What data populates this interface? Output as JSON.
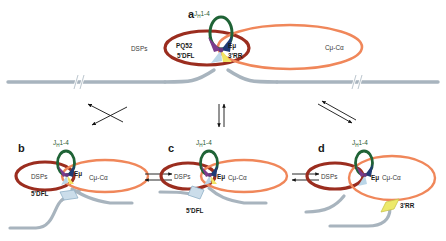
{
  "figure": {
    "colors": {
      "dsp_loop": "#9B2D1F",
      "constant_loop": "#F0875A",
      "jh_loop": "#1F6336",
      "dna_strand": "#A8B4BE",
      "hub_purple": "#7B3B8C",
      "hub_navy": "#1F3A75",
      "hub_lightblue": "#BBD6E8",
      "hub_yellow": "#F2E463",
      "diamond_yellow": "#EDE96A",
      "arrow": "#111111",
      "text": "#3a3a3a"
    }
  },
  "panels": [
    {
      "id": "a",
      "letter": "a",
      "labels": {
        "jh": "J",
        "jh_sub": "H",
        "jh_rest": "1-4",
        "dsps": "DSPs",
        "pq52": "PQ52",
        "emu": "Eμ",
        "dfl": "5'DFL",
        "rr": "3'RR",
        "constant": "Cμ-Cα"
      }
    },
    {
      "id": "b",
      "letter": "b",
      "labels": {
        "jh": "J",
        "jh_sub": "H",
        "jh_rest": "1-4",
        "dsps": "DSPs",
        "emu": "Eμ",
        "dfl": "5'DFL",
        "constant": "Cμ-Cα"
      }
    },
    {
      "id": "c",
      "letter": "c",
      "labels": {
        "jh": "J",
        "jh_sub": "H",
        "jh_rest": "1-4",
        "dsps": "DSPs",
        "emu": "Eμ",
        "dfl": "5'DFL",
        "constant": "Cμ-Cα"
      }
    },
    {
      "id": "d",
      "letter": "d",
      "labels": {
        "jh": "J",
        "jh_sub": "H",
        "jh_rest": "1-4",
        "dsps": "DSPs",
        "emu": "Eμ",
        "rr": "3'RR",
        "constant": "Cμ-Cα"
      }
    }
  ],
  "arrows": {
    "a_to_b": "equilibrium-arrow-diagonal-left",
    "a_to_c": "equilibrium-arrow-vertical",
    "a_to_d": "equilibrium-arrow-diagonal-right",
    "b_to_c": "equilibrium-arrow-horizontal",
    "c_to_d": "equilibrium-arrow-horizontal"
  }
}
